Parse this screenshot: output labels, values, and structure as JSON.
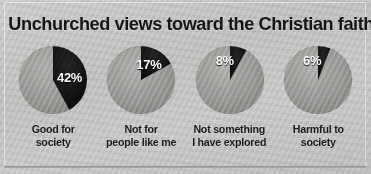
{
  "title": "Unchurched views toward the Christian faith",
  "colors": {
    "background": "#c9c9c7",
    "slice_highlight": "#111111",
    "slice_remainder": "#9a9a98",
    "title_text": "#141414",
    "percent_text": "#ffffff",
    "caption_text": "#1a1a1a"
  },
  "chart_data": {
    "type": "pie",
    "title": "Unchurched views toward the Christian faith",
    "xlabel": "",
    "ylabel": "",
    "legend": "none",
    "note": "Four separate single-value pie charts; highlighted dark wedge starts at 12 o'clock and sweeps clockwise.",
    "categories": [
      "Good for society",
      "Not for people like me",
      "Not something I have explored",
      "Harmful to society"
    ],
    "values": [
      42,
      17,
      8,
      6
    ],
    "value_labels": [
      "42%",
      "17%",
      "8%",
      "6%"
    ],
    "units": "percent",
    "series": [
      {
        "name": "Highlighted share",
        "values": [
          42,
          17,
          8,
          6
        ]
      },
      {
        "name": "Remainder",
        "values": [
          58,
          83,
          92,
          94
        ]
      }
    ]
  },
  "pies": [
    {
      "value": 42,
      "percent_label": "42%",
      "caption_line1": "Good for",
      "caption_line2": "society"
    },
    {
      "value": 17,
      "percent_label": "17%",
      "caption_line1": "Not for",
      "caption_line2": "people like me"
    },
    {
      "value": 8,
      "percent_label": "8%",
      "caption_line1": "Not something",
      "caption_line2": "I have explored"
    },
    {
      "value": 6,
      "percent_label": "6%",
      "caption_line1": "Harmful to",
      "caption_line2": "society"
    }
  ]
}
